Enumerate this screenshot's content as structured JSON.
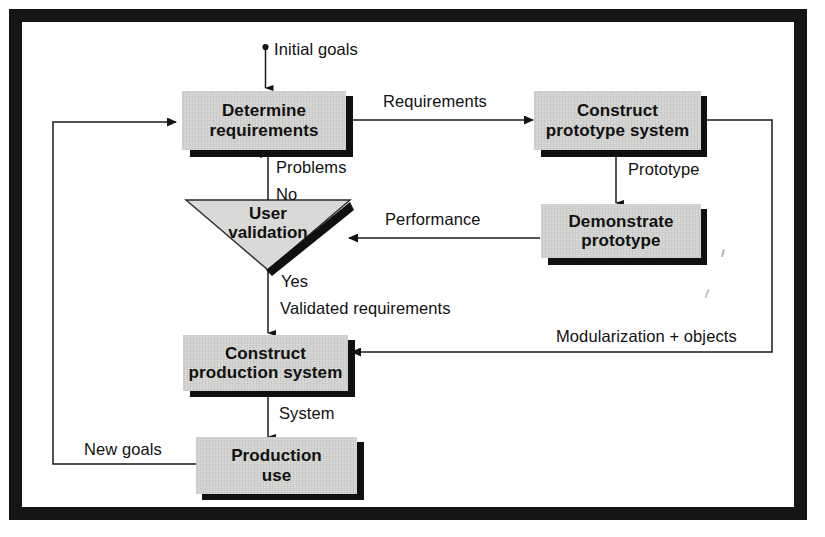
{
  "diagram": {
    "fill_color": "#d9d9d7",
    "shadow_color": "#101010",
    "line_color": "#1a1a1a",
    "frame_color": "#151515",
    "nodes": [
      {
        "id": "determine",
        "label_line1": "Determine",
        "label_line2": "requirements",
        "shape": "process"
      },
      {
        "id": "construct-prototype",
        "label_line1": "Construct",
        "label_line2": "prototype system",
        "shape": "process"
      },
      {
        "id": "demonstrate",
        "label_line1": "Demonstrate",
        "label_line2": "prototype",
        "shape": "process"
      },
      {
        "id": "user-validation",
        "label_line1": "User",
        "label_line2": "validation",
        "shape": "decision"
      },
      {
        "id": "construct-production",
        "label_line1": "Construct",
        "label_line2": "production system",
        "shape": "process"
      },
      {
        "id": "production-use",
        "label_line1": "Production",
        "label_line2": "use",
        "shape": "process"
      }
    ],
    "edges": [
      {
        "id": "initial-goals",
        "label": "Initial goals",
        "from": "start",
        "to": "determine"
      },
      {
        "id": "requirements",
        "label": "Requirements",
        "from": "determine",
        "to": "construct-prototype"
      },
      {
        "id": "prototype",
        "label": "Prototype",
        "from": "construct-prototype",
        "to": "demonstrate"
      },
      {
        "id": "performance",
        "label": "Performance",
        "from": "demonstrate",
        "to": "user-validation"
      },
      {
        "id": "problems",
        "label": "Problems",
        "from": "user-validation",
        "to": "determine"
      },
      {
        "id": "no",
        "label": "No",
        "from": "user-validation",
        "to": "determine"
      },
      {
        "id": "yes",
        "label": "Yes",
        "from": "user-validation",
        "to": "construct-production"
      },
      {
        "id": "validated-requirements",
        "label": "Validated requirements",
        "from": "user-validation",
        "to": "construct-production"
      },
      {
        "id": "modularization",
        "label": "Modularization + objects",
        "from": "construct-prototype",
        "to": "construct-production"
      },
      {
        "id": "system",
        "label": "System",
        "from": "construct-production",
        "to": "production-use"
      },
      {
        "id": "new-goals",
        "label": "New goals",
        "from": "production-use",
        "to": "determine"
      }
    ]
  }
}
